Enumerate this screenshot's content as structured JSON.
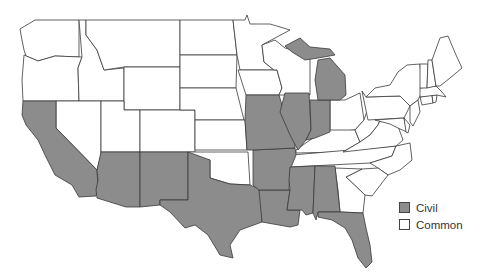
{
  "map": {
    "title": "",
    "colors": {
      "civil": "#8c8c8c",
      "common": "#ffffff",
      "border": "#3a3a3a"
    },
    "states_civil": [
      "California",
      "Arizona",
      "New Mexico",
      "Texas",
      "Louisiana",
      "Arkansas",
      "Missouri",
      "Illinois",
      "Indiana",
      "Michigan",
      "Mississippi",
      "Alabama",
      "Florida"
    ],
    "states_common": [
      "Washington",
      "Oregon",
      "Idaho",
      "Montana",
      "Wyoming",
      "Nevada",
      "Utah",
      "Colorado",
      "North Dakota",
      "South Dakota",
      "Nebraska",
      "Kansas",
      "Oklahoma",
      "Minnesota",
      "Iowa",
      "Wisconsin",
      "Ohio",
      "Kentucky",
      "Tennessee",
      "Georgia",
      "South Carolina",
      "North Carolina",
      "Virginia",
      "West Virginia",
      "Pennsylvania",
      "New York",
      "Maryland",
      "Delaware",
      "New Jersey",
      "Connecticut",
      "Rhode Island",
      "Massachusetts",
      "Vermont",
      "New Hampshire",
      "Maine"
    ]
  },
  "legend": {
    "items": [
      {
        "label": "Civil",
        "color": "#8c8c8c"
      },
      {
        "label": "Common",
        "color": "#ffffff"
      }
    ]
  }
}
